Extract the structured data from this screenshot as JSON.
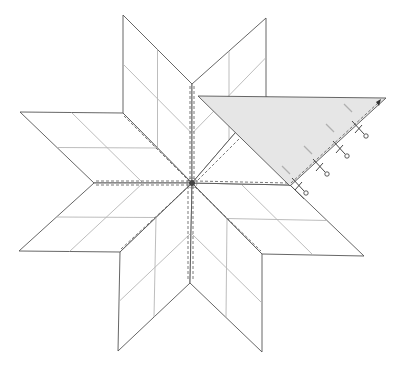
{
  "figure": {
    "center": [
      192,
      183
    ],
    "colors": {
      "outline": "#555555",
      "grid": "#b5b5b5",
      "triangle_fill": "#e6e6e6",
      "background": "#ffffff"
    },
    "diamonds": [
      {
        "name": "top-left",
        "points": [
          [
            192,
            183
          ],
          [
            192,
            84
          ],
          [
            123,
            15
          ],
          [
            123,
            113
          ]
        ]
      },
      {
        "name": "top-right",
        "points": [
          [
            192,
            183
          ],
          [
            192,
            84
          ],
          [
            266,
            18
          ],
          [
            266,
            97
          ]
        ]
      },
      {
        "name": "left-upper",
        "points": [
          [
            192,
            183
          ],
          [
            123,
            113
          ],
          [
            20,
            112
          ],
          [
            94,
            183
          ]
        ]
      },
      {
        "name": "left-lower",
        "points": [
          [
            192,
            183
          ],
          [
            94,
            183
          ],
          [
            19,
            251
          ],
          [
            120,
            252
          ]
        ]
      },
      {
        "name": "bottom-left",
        "points": [
          [
            192,
            183
          ],
          [
            120,
            252
          ],
          [
            118,
            351
          ],
          [
            190,
            283
          ]
        ]
      },
      {
        "name": "bottom-right",
        "points": [
          [
            192,
            183
          ],
          [
            190,
            283
          ],
          [
            262,
            352
          ],
          [
            262,
            254
          ]
        ]
      },
      {
        "name": "right-lower",
        "points": [
          [
            192,
            183
          ],
          [
            262,
            254
          ],
          [
            364,
            256
          ],
          [
            290,
            185
          ]
        ]
      },
      {
        "name": "right-upper",
        "points": [
          [
            192,
            183
          ],
          [
            290,
            185
          ],
          [
            364,
            116
          ],
          [
            266,
            97
          ]
        ]
      }
    ],
    "setting_triangle": {
      "points": [
        [
          198,
          96
        ],
        [
          386,
          98
        ],
        [
          290,
          186
        ]
      ],
      "pins": 4
    }
  }
}
